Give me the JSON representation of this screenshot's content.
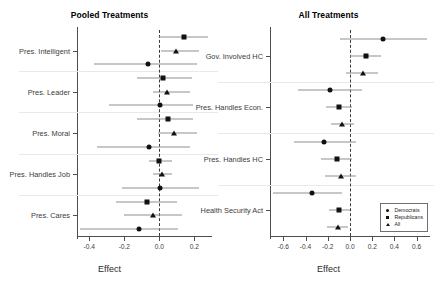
{
  "figure": {
    "width": 438,
    "height": 294,
    "background": "#ffffff",
    "series_colors": {
      "point": "#111111",
      "interval": "#8f8f8f",
      "zero_line": "#3a3a3a"
    }
  },
  "legend": {
    "position": "bottom-right of right panel",
    "entries": [
      {
        "label": "Democrats",
        "marker": "circle"
      },
      {
        "label": "Republicans",
        "marker": "square"
      },
      {
        "label": "All",
        "marker": "triangle"
      }
    ]
  },
  "chart_data": [
    {
      "type": "scatter",
      "subtype": "coefficient-forest-plot",
      "title": "Pooled Treatments",
      "xlabel": "Effect",
      "ylabel": "",
      "xlim": [
        -0.47,
        0.3
      ],
      "xticks": [
        -0.4,
        -0.2,
        0.0,
        0.2
      ],
      "xticklabels": [
        "-0.4",
        "-0.2",
        "0.0",
        "0.2"
      ],
      "grid": false,
      "zero_reference": 0.0,
      "categories": [
        "Pres. Intelligent",
        "Pres. Leader",
        "Pres. Moral",
        "Pres. Handles Job",
        "Pres. Cares"
      ],
      "series": [
        {
          "name": "Democrats",
          "marker": "circle",
          "values": [
            -0.065,
            0.005,
            -0.06,
            0.002,
            -0.118
          ],
          "ci_low": [
            -0.375,
            -0.29,
            -0.355,
            -0.215,
            -0.455
          ],
          "ci_high": [
            0.215,
            0.19,
            0.175,
            0.225,
            0.105
          ]
        },
        {
          "name": "Republicans",
          "marker": "square",
          "values": [
            0.14,
            0.02,
            0.05,
            0.0,
            -0.07
          ],
          "ci_low": [
            0.0,
            -0.13,
            -0.125,
            -0.06,
            -0.25
          ],
          "ci_high": [
            0.275,
            0.185,
            0.19,
            0.07,
            0.098
          ]
        },
        {
          "name": "All",
          "marker": "triangle",
          "values": [
            0.097,
            0.042,
            0.082,
            0.014,
            -0.035
          ],
          "ci_low": [
            0.01,
            -0.035,
            -0.01,
            -0.035,
            -0.2
          ],
          "ci_high": [
            0.225,
            0.175,
            0.215,
            0.072,
            0.13
          ]
        }
      ]
    },
    {
      "type": "scatter",
      "subtype": "coefficient-forest-plot",
      "title": "All Treatments",
      "xlabel": "Effect",
      "ylabel": "",
      "xlim": [
        -0.72,
        0.72
      ],
      "xticks": [
        -0.6,
        -0.4,
        -0.2,
        0.0,
        0.2,
        0.4,
        0.6
      ],
      "xticklabels": [
        "-0.6",
        "-0.4",
        "-0.2",
        "0.0",
        "0.2",
        "0.4",
        "0.6"
      ],
      "grid": false,
      "zero_reference": 0.0,
      "categories": [
        "Gov. Involved HC",
        "Pres. Handles Econ.",
        "Pres. Handles HC",
        "Health Security Act"
      ],
      "series": [
        {
          "name": "Democrats",
          "marker": "circle",
          "values": [
            0.3,
            -0.18,
            -0.23,
            -0.34
          ],
          "ci_low": [
            -0.09,
            -0.47,
            -0.5,
            -0.69
          ],
          "ci_high": [
            0.69,
            0.105,
            0.055,
            -0.075
          ]
        },
        {
          "name": "Republicans",
          "marker": "square",
          "values": [
            0.14,
            -0.095,
            -0.12,
            -0.095
          ],
          "ci_low": [
            0.0,
            -0.215,
            -0.265,
            -0.19
          ],
          "ci_high": [
            0.28,
            0.02,
            0.02,
            0.0
          ]
        },
        {
          "name": "All",
          "marker": "triangle",
          "values": [
            0.115,
            -0.07,
            -0.085,
            -0.11
          ],
          "ci_low": [
            -0.035,
            -0.175,
            -0.225,
            -0.205
          ],
          "ci_high": [
            0.25,
            0.04,
            0.05,
            -0.015
          ]
        }
      ]
    }
  ]
}
